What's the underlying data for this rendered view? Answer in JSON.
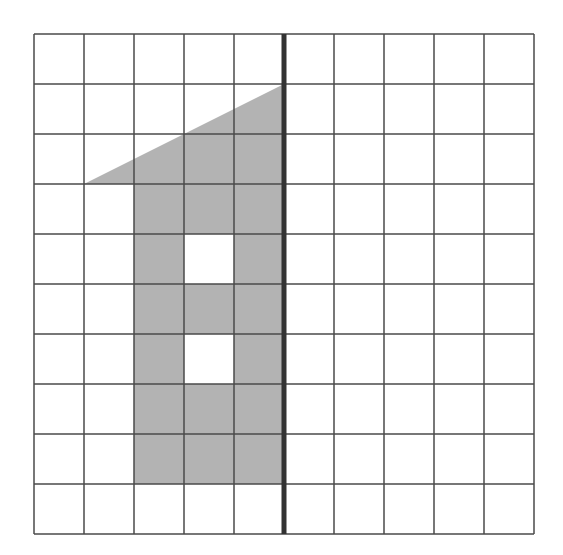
{
  "diagram": {
    "type": "grid-figure",
    "grid": {
      "columns": 10,
      "rows": 10,
      "origin_x": 34,
      "origin_y": 34,
      "cell_size": 50,
      "line_color": "#4a4a4a",
      "background": "#ffffff"
    },
    "symmetry_line": {
      "column_index": 5,
      "color": "#333333",
      "width": 5
    },
    "shape": {
      "fill": "#b3b3b3",
      "outline_points_grid": [
        [
          5,
          1
        ],
        [
          1,
          3
        ],
        [
          2,
          3
        ],
        [
          2,
          9
        ],
        [
          5,
          9
        ]
      ],
      "holes_cells": [
        [
          3,
          4
        ],
        [
          3,
          6
        ]
      ]
    }
  }
}
